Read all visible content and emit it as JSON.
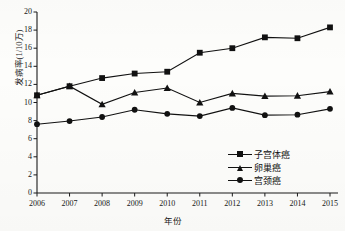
{
  "chart_data": {
    "type": "line",
    "title": "",
    "xlabel": "年份",
    "ylabel": "发病率(1/10万)",
    "categories": [
      "2006",
      "2007",
      "2008",
      "2009",
      "2010",
      "2011",
      "2012",
      "2013",
      "2014",
      "2015"
    ],
    "ylim": [
      0,
      20
    ],
    "yticks": [
      "0",
      "2",
      "4",
      "6",
      "8",
      "10",
      "12",
      "14",
      "16",
      "18",
      "20"
    ],
    "grid": false,
    "legend_position": "bottom-right",
    "series": [
      {
        "name": "子宫体癌",
        "marker": "square",
        "values": [
          10.8,
          11.8,
          12.7,
          13.2,
          13.4,
          15.5,
          16.0,
          17.2,
          17.1,
          18.3
        ]
      },
      {
        "name": "卵巢癌",
        "marker": "triangle",
        "values": [
          10.8,
          11.8,
          9.8,
          11.1,
          11.6,
          10.0,
          11.0,
          10.7,
          10.75,
          11.2
        ]
      },
      {
        "name": "宫颈癌",
        "marker": "circle",
        "values": [
          7.6,
          7.95,
          8.4,
          9.2,
          8.75,
          8.5,
          9.4,
          8.6,
          8.65,
          9.3
        ]
      }
    ],
    "colors": {
      "line": "#111111",
      "axis": "#1a1a1a",
      "background": "#fdfdfb"
    }
  }
}
